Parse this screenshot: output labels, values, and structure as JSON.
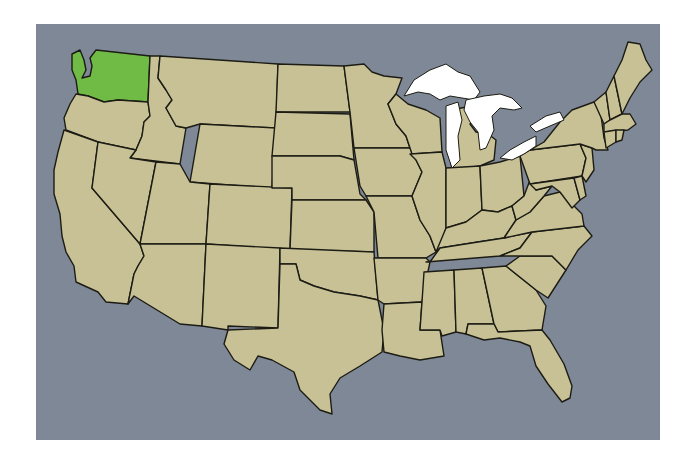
{
  "map": {
    "title": "United States map",
    "highlighted_state": "Washington",
    "colors": {
      "water": "#7f8896",
      "land": "#c8c196",
      "highlight": "#6fbb45",
      "lakes": "#ffffff",
      "border": "#1c1c14",
      "page": "#ffffff"
    },
    "states": [
      {
        "name": "Washington",
        "highlight": true,
        "pts": "72,54 80,50 84,60 86,70 82,78 90,76 92,66 90,58 96,50 150,56 148,102 118,100 104,102 88,96 78,94 76,80 72,70"
      },
      {
        "name": "Oregon",
        "pts": "76,94 88,96 104,102 118,100 148,102 150,116 144,122 142,136 136,150 98,142 66,130 64,118 70,104"
      },
      {
        "name": "California",
        "pts": "64,130 98,142 92,188 140,244 144,256 138,266 134,274 128,304 106,302 98,292 76,282 74,266 66,252 62,236 60,214 54,194 54,170 58,152"
      },
      {
        "name": "Idaho",
        "pts": "150,56 160,56 158,78 166,90 172,100 166,108 176,126 186,128 180,164 130,158 136,150 142,136 144,122 150,116 148,102"
      },
      {
        "name": "Nevada",
        "pts": "98,142 136,150 130,158 156,162 140,244 92,188"
      },
      {
        "name": "Montana",
        "pts": "160,56 278,64 276,128 200,124 186,128 176,126 166,108 172,100 166,90 158,78"
      },
      {
        "name": "Wyoming",
        "pts": "200,124 276,128 272,188 190,182"
      },
      {
        "name": "Utah",
        "pts": "156,162 180,164 190,182 210,184 206,244 140,244"
      },
      {
        "name": "Arizona",
        "pts": "140,244 206,244 202,326 180,324 134,296 128,304 134,274 138,266 144,256"
      },
      {
        "name": "Colorado",
        "pts": "210,184 292,188 290,250 206,244"
      },
      {
        "name": "New Mexico",
        "pts": "206,244 280,248 278,328 228,326 228,330 202,326"
      },
      {
        "name": "North Dakota",
        "pts": "278,64 344,66 350,112 276,112"
      },
      {
        "name": "South Dakota",
        "pts": "276,112 350,114 354,160 340,156 272,156"
      },
      {
        "name": "Nebraska",
        "pts": "272,156 340,156 354,160 360,194 366,200 292,200 292,188 272,188"
      },
      {
        "name": "Kansas",
        "pts": "292,200 366,200 374,212 374,252 290,250"
      },
      {
        "name": "Oklahoma",
        "pts": "280,248 374,252 378,300 360,296 334,292 314,286 300,280 296,264 280,264"
      },
      {
        "name": "Texas",
        "pts": "280,264 296,264 300,280 314,286 334,292 360,296 378,300 384,330 382,352 360,366 340,378 330,394 332,414 320,410 300,390 294,372 272,360 258,356 250,370 234,360 224,344 228,330 278,328"
      },
      {
        "name": "Minnesota",
        "pts": "344,66 364,64 372,72 384,76 402,78 396,94 388,104 396,124 406,136 410,148 354,148 350,112"
      },
      {
        "name": "Iowa",
        "pts": "354,148 410,148 416,160 422,172 412,196 366,196 360,186"
      },
      {
        "name": "Missouri",
        "pts": "366,196 412,196 420,220 430,236 436,252 426,258 378,258 374,212"
      },
      {
        "name": "Arkansas",
        "pts": "374,258 426,258 430,262 424,290 422,302 384,304 378,300"
      },
      {
        "name": "Louisiana",
        "pts": "384,304 422,302 420,330 440,330 444,356 420,360 400,356 384,352 382,330"
      },
      {
        "name": "Wisconsin",
        "pts": "396,94 408,104 426,110 440,118 442,152 412,154 406,136 396,124 388,104"
      },
      {
        "name": "Illinois",
        "pts": "410,154 442,152 446,168 446,228 442,244 436,252 430,236 420,220 412,196 422,172 416,160"
      },
      {
        "name": "Michigan",
        "pts": "452,110 480,104 486,118 470,124 476,132 488,134 496,140 494,160 480,166 452,170 448,140 452,126"
      },
      {
        "name": "Indiana",
        "pts": "446,168 480,166 482,210 466,222 446,228"
      },
      {
        "name": "Ohio",
        "pts": "480,166 500,162 520,156 524,196 512,206 498,212 482,210"
      },
      {
        "name": "Kentucky",
        "pts": "436,252 446,228 466,222 482,210 498,212 512,206 516,220 504,238 478,242 440,248"
      },
      {
        "name": "Tennessee",
        "pts": "430,262 440,248 478,242 504,238 532,232 520,248 500,256 426,262"
      },
      {
        "name": "Mississippi",
        "pts": "424,272 454,270 456,332 442,336 440,330 420,330 422,302"
      },
      {
        "name": "Alabama",
        "pts": "454,270 482,268 494,324 468,324 466,334 456,332"
      },
      {
        "name": "Georgia",
        "pts": "482,268 506,266 536,290 546,306 542,330 498,332 494,324"
      },
      {
        "name": "Florida",
        "pts": "466,334 468,324 494,324 498,332 542,330 550,340 564,364 572,386 570,398 562,402 548,384 536,366 530,346 520,342 500,338 484,340"
      },
      {
        "name": "South Carolina",
        "pts": "506,266 520,256 552,256 566,270 548,298 536,290"
      },
      {
        "name": "North Carolina",
        "pts": "500,256 520,248 532,232 584,226 592,236 578,250 566,270 552,256 520,256"
      },
      {
        "name": "Virginia",
        "pts": "504,238 516,220 530,212 544,196 560,192 570,202 582,214 584,226 532,232"
      },
      {
        "name": "West Virginia",
        "pts": "512,206 524,196 530,180 536,190 552,186 544,196 530,212 516,220"
      },
      {
        "name": "Pennsylvania",
        "pts": "520,156 530,150 580,144 586,158 582,176 530,184"
      },
      {
        "name": "Maryland",
        "pts": "530,184 574,178 580,200 572,208 560,192 552,186 536,190"
      },
      {
        "name": "Delaware",
        "pts": "574,178 582,176 586,196 580,200"
      },
      {
        "name": "New Jersey",
        "pts": "580,144 592,148 594,170 586,182 582,176 586,158"
      },
      {
        "name": "New York",
        "pts": "530,150 544,142 560,122 572,110 594,102 600,108 604,138 608,150 596,150 592,148 580,144"
      },
      {
        "name": "Vermont",
        "pts": "594,102 606,92 610,120 604,124"
      },
      {
        "name": "New Hampshire",
        "pts": "606,92 614,76 622,114 610,120"
      },
      {
        "name": "Massachusetts",
        "pts": "604,124 610,120 622,114 630,114 636,124 628,130 604,132"
      },
      {
        "name": "Connecticut",
        "pts": "604,132 616,130 616,142 606,148"
      },
      {
        "name": "Rhode Island",
        "pts": "616,130 624,130 622,140 616,142"
      },
      {
        "name": "Maine",
        "pts": "614,76 622,60 628,42 640,44 646,60 652,70 640,82 630,98 622,114"
      }
    ],
    "lakes": [
      {
        "name": "Lake Superior",
        "pts": "404,96 414,80 430,70 446,64 458,72 470,76 480,92 474,100 462,98 450,96 440,100 430,94 418,92"
      },
      {
        "name": "Lake Michigan",
        "pts": "446,106 458,102 462,120 458,136 460,160 452,168 446,150 446,126"
      },
      {
        "name": "Lake Huron",
        "pts": "466,100 484,96 500,94 512,98 522,108 514,110 500,108 492,116 494,130 486,148 480,150 478,132 470,122 464,110"
      },
      {
        "name": "Lake Erie",
        "pts": "500,158 510,150 524,142 536,136 536,146 524,154 512,160"
      },
      {
        "name": "Lake Ontario",
        "pts": "530,126 546,116 560,112 564,120 550,126 536,132"
      }
    ]
  }
}
